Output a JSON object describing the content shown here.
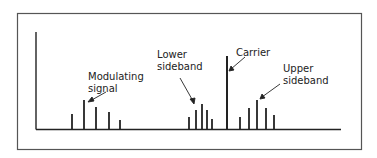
{
  "labels": {
    "modulating_line1": "Modulating",
    "modulating_line2": "signal",
    "lower_line1": "Lower",
    "lower_line2": "sideband",
    "carrier": "Carrier",
    "upper_line1": "Upper",
    "upper_line2": "sideband"
  },
  "colors": {
    "ink": "#222222",
    "frame": "#555555"
  },
  "spectrum": {
    "modulating_signal": [
      {
        "x": 72,
        "top": 114
      },
      {
        "x": 84,
        "top": 100
      },
      {
        "x": 96,
        "top": 107
      },
      {
        "x": 109,
        "top": 112
      },
      {
        "x": 120,
        "top": 120
      }
    ],
    "lower_sideband": [
      {
        "x": 189,
        "top": 117
      },
      {
        "x": 196,
        "top": 110
      },
      {
        "x": 202,
        "top": 104
      },
      {
        "x": 207,
        "top": 110
      },
      {
        "x": 212,
        "top": 119
      }
    ],
    "carrier": {
      "x": 227,
      "top": 56
    },
    "upper_sideband": [
      {
        "x": 240,
        "top": 117
      },
      {
        "x": 249,
        "top": 108
      },
      {
        "x": 257,
        "top": 100
      },
      {
        "x": 266,
        "top": 108
      },
      {
        "x": 274,
        "top": 115
      }
    ]
  }
}
